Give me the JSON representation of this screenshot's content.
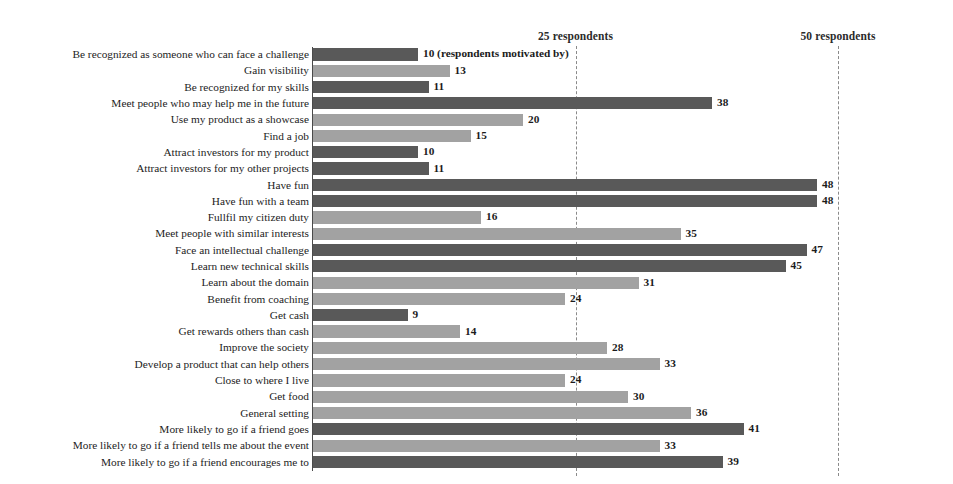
{
  "chart_data": {
    "type": "bar",
    "orientation": "horizontal",
    "title": "",
    "xlabel": "",
    "ylabel": "",
    "xlim": [
      0,
      50
    ],
    "grid": true,
    "gridlines": [
      {
        "value": 25,
        "label": "25 respondents"
      },
      {
        "value": 50,
        "label": "50 respondents"
      }
    ],
    "legend": [],
    "annotations": [
      {
        "text": "(respondents motivated by)",
        "attached_to": "Be recognized as someone who can face a challenge"
      }
    ],
    "series_colors": {
      "dark": "#595959",
      "light": "#a2a2a2"
    },
    "categories": [
      "Be recognized as someone who can face a challenge",
      "Gain visibility",
      "Be recognized for my skills",
      "Meet people who may help me in the future",
      "Use my product as a showcase",
      "Find a job",
      "Attract investors for my product",
      "Attract investors for my other projects",
      "Have fun",
      "Have fun with a team",
      "Fullfil my citizen duty",
      "Meet people with similar interests",
      "Face an intellectual challenge",
      "Learn new technical skills",
      "Learn about the domain",
      "Benefit from coaching",
      "Get cash",
      "Get rewards others than cash",
      "Improve the society",
      "Develop a product that can help others",
      "Close to where I live",
      "Get food",
      "General setting",
      "More likely to go if a friend goes",
      "More likely to go if a friend tells me about the event",
      "More likely to go if a friend encourages me to"
    ],
    "values": [
      10,
      13,
      11,
      38,
      20,
      15,
      10,
      11,
      48,
      48,
      16,
      35,
      47,
      45,
      31,
      24,
      9,
      14,
      28,
      33,
      24,
      30,
      36,
      41,
      33,
      39
    ],
    "value_labels": [
      "10 (respondents motivated by)",
      "13",
      "11",
      "38",
      "20",
      "15",
      "10",
      "11",
      "48",
      "48",
      "16",
      "35",
      "47",
      "45",
      "31",
      "24",
      "9",
      "14",
      "28",
      "33",
      "24",
      "30",
      "36",
      "41",
      "33",
      "39"
    ],
    "bar_shades": [
      "dark",
      "light",
      "dark",
      "dark",
      "light",
      "light",
      "dark",
      "dark",
      "dark",
      "dark",
      "light",
      "light",
      "dark",
      "dark",
      "light",
      "light",
      "dark",
      "light",
      "light",
      "light",
      "light",
      "light",
      "light",
      "dark",
      "light",
      "dark"
    ]
  }
}
